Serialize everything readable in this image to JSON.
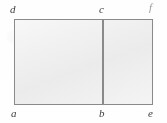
{
  "figure": {
    "kind": "geometry-diagram",
    "background_color": "#fefefe",
    "fill_color": "#eeeeee",
    "stroke_color": "#8a8a8a",
    "label_color": "#3c3c3c",
    "shapes": {
      "outer_rectangle": {
        "name": "outer-rectangle",
        "vertices": [
          "a",
          "e",
          "f",
          "d"
        ],
        "x": 14,
        "y": 19,
        "width": 139,
        "height": 86
      },
      "divider": {
        "name": "divider-bc",
        "endpoints": [
          "b",
          "c"
        ],
        "x": 102,
        "y": 19,
        "length": 86,
        "orientation": "vertical"
      },
      "left_rectangle": {
        "name": "left-rectangle",
        "vertices": [
          "a",
          "b",
          "c",
          "d"
        ]
      },
      "right_rectangle": {
        "name": "right-rectangle",
        "vertices": [
          "b",
          "e",
          "f",
          "c"
        ]
      }
    },
    "labels": [
      {
        "id": "d",
        "text": "d",
        "position": "top-left",
        "x": 10,
        "y": 4,
        "faint": false
      },
      {
        "id": "c",
        "text": "c",
        "position": "top-middle",
        "x": 99,
        "y": 4,
        "faint": false
      },
      {
        "id": "f",
        "text": "f",
        "position": "top-right",
        "x": 149,
        "y": 2,
        "faint": true
      },
      {
        "id": "a",
        "text": "a",
        "position": "bottom-left",
        "x": 11,
        "y": 108,
        "faint": false
      },
      {
        "id": "b",
        "text": "b",
        "position": "bottom-middle",
        "x": 99,
        "y": 108,
        "faint": false
      },
      {
        "id": "e",
        "text": "e",
        "position": "bottom-right",
        "x": 148,
        "y": 108,
        "faint": false
      }
    ]
  }
}
